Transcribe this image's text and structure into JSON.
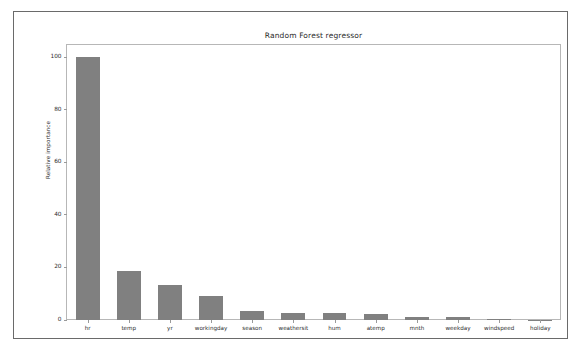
{
  "chart_data": {
    "type": "bar",
    "title": "Random Forest regressor",
    "xlabel": "",
    "ylabel": "Relative importance",
    "categories": [
      "hr",
      "temp",
      "yr",
      "workingday",
      "season",
      "weathersit",
      "hum",
      "atemp",
      "mnth",
      "weekday",
      "windspeed",
      "holiday"
    ],
    "values": [
      100.0,
      18.7,
      13.5,
      9.2,
      3.5,
      2.7,
      2.7,
      2.2,
      1.2,
      1.0,
      0.4,
      0.1
    ],
    "ylim": [
      0,
      105
    ],
    "yticks": [
      0,
      20,
      40,
      60,
      80,
      100
    ],
    "ytick_labels": [
      "0",
      "20",
      "40",
      "60",
      "80",
      "100"
    ],
    "grid": false,
    "legend": null,
    "bar_color": "#808080",
    "axes_edge_color": "#b7b7b7",
    "figure_edge_color": "#6a6a6a",
    "background_color": "#ffffff"
  }
}
